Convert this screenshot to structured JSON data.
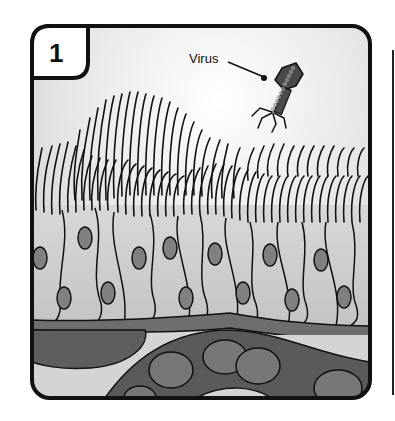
{
  "panel": {
    "number": "1",
    "labels": {
      "virus": "Virus"
    }
  },
  "colors": {
    "outline": "#111111",
    "background_light": "#f2f2f2",
    "background_mid": "#dcdcdc",
    "cell_fill": "#c8c8c8",
    "nucleus": "#808080",
    "membrane": "#6e6e6e",
    "vessel": "#5a5a5a",
    "vessel_cell": "#777777",
    "virus_body": "#4a4a4a"
  }
}
